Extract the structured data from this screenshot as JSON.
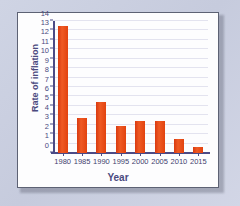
{
  "chart_data": {
    "type": "bar",
    "title": "",
    "xlabel": "Year",
    "ylabel": "Rate of inflation",
    "categories": [
      "1980",
      "1985",
      "1990",
      "1995",
      "2000",
      "2005",
      "2010",
      "2015"
    ],
    "values": [
      13.5,
      3.7,
      5.4,
      2.85,
      3.35,
      3.35,
      1.5,
      0.6
    ],
    "ylim": [
      0,
      14
    ],
    "ytick_labels": [
      "0",
      "1",
      "2",
      "3",
      "4",
      "5",
      "6",
      "7",
      "8",
      "9",
      "10",
      "11",
      "12",
      "13",
      "14"
    ],
    "ytick_values": [
      0,
      1,
      2,
      3,
      4,
      5,
      6,
      7,
      8,
      9,
      10,
      11,
      12,
      13,
      14
    ],
    "grid": true,
    "legend": false,
    "bar_color": "#e8451a",
    "axis_color": "#4b4a86",
    "grid_color": "#e3e3ef",
    "text_color": "#4b4a7e",
    "panel_color": "#fdfdfe",
    "background_color": "#c9cfe0"
  }
}
